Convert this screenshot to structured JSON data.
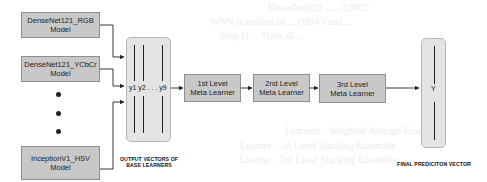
{
  "base_learners": [
    {
      "line1": "DenseNet121_RGB",
      "line2": "Model"
    },
    {
      "line1": "DenseNet121_YCbCr",
      "line2": "Model"
    },
    {
      "line1": "InceptionV1_HSV",
      "line2": "Model"
    }
  ],
  "output_vectors": {
    "label": "y1 y2 . . . y9",
    "caption_line1": "OUTPUT VECTORS OF",
    "caption_line2": "BASE LEARNERS"
  },
  "meta_learners": [
    {
      "line1": "1st Level",
      "line2": "Meta Learner"
    },
    {
      "line1": "2nd Level",
      "line2": "Meta Learner"
    },
    {
      "line1": "3rd Level",
      "line2": "Meta Learner"
    }
  ],
  "final_vector": {
    "label": "Y",
    "caption": "FINAL PREDICITON VECTOR"
  },
  "colors": {
    "box_fill": "#c8c8c8",
    "vector_fill": "#e4e4e4",
    "line": "#222222"
  },
  "ghost_text": [
    "DenseNet121 ...... UNET",
    "WNN is trained on ... (HSV) and ...",
    "Step 1) ... Train all ...",
    "Learners - Weighted Average Ensemble",
    "Learner - 1st Level Stacking Ensemble",
    "Learner - 3rd Level Stacking Ensemble"
  ]
}
